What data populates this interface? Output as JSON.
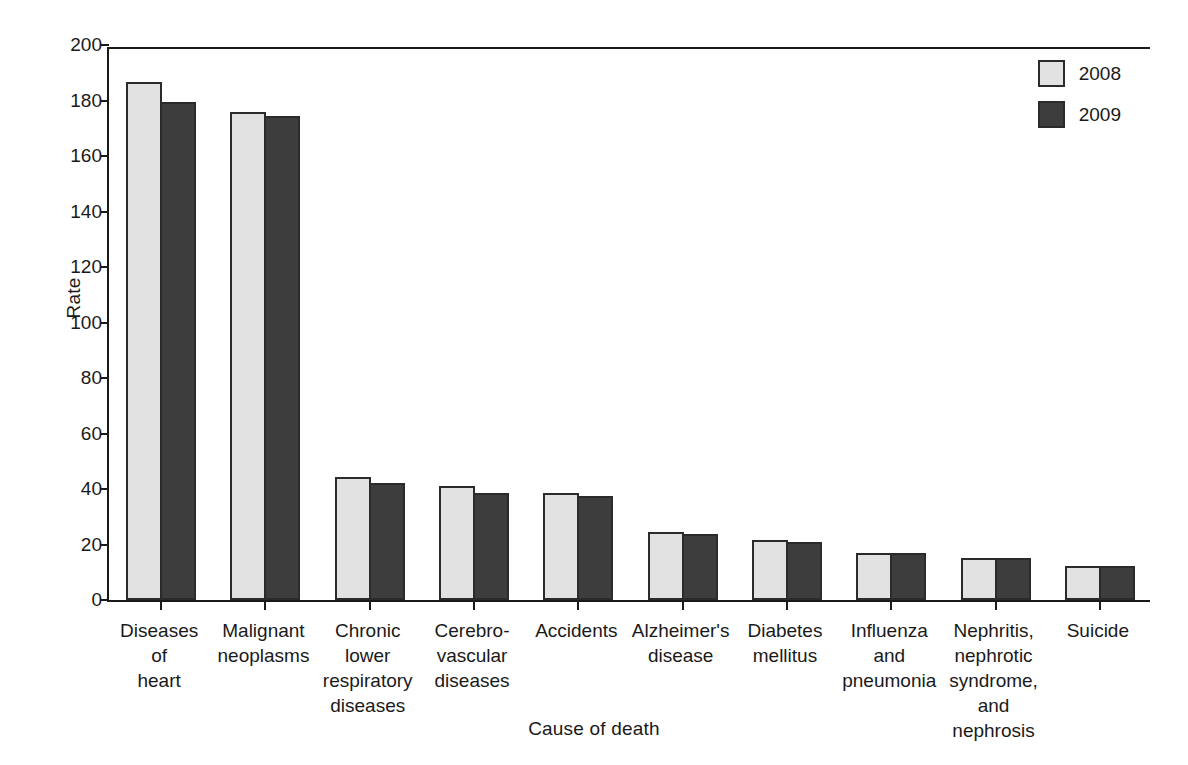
{
  "chart_data": {
    "type": "bar",
    "title": "",
    "xlabel": "Cause of death",
    "ylabel": "Rate",
    "ylim": [
      0,
      200
    ],
    "yticks": [
      0,
      20,
      40,
      60,
      80,
      100,
      120,
      140,
      160,
      180,
      200
    ],
    "grid": false,
    "legend_position": "top-right",
    "categories": [
      "Diseases\nof\nheart",
      "Malignant\nneoplasms",
      "Chronic\nlower\nrespiratory\ndiseases",
      "Cerebro-\nvascular\ndiseases",
      "Accidents",
      "Alzheimer's\ndisease",
      "Diabetes\nmellitus",
      "Influenza\nand\npneumonia",
      "Nephritis,\nnephrotic\nsyndrome,\nand\nnephrosis",
      "Suicide"
    ],
    "category_lines": [
      [
        "Diseases",
        "of",
        "heart"
      ],
      [
        "Malignant",
        "neoplasms"
      ],
      [
        "Chronic",
        "lower",
        "respiratory",
        "diseases"
      ],
      [
        "Cerebro-",
        "vascular",
        "diseases"
      ],
      [
        "Accidents"
      ],
      [
        "Alzheimer's",
        "disease"
      ],
      [
        "Diabetes",
        "mellitus"
      ],
      [
        "Influenza",
        "and",
        "pneumonia"
      ],
      [
        "Nephritis,",
        "nephrotic",
        "syndrome,",
        "and",
        "nephrosis"
      ],
      [
        "Suicide"
      ]
    ],
    "series": [
      {
        "name": "2008",
        "color": "#e2e2e2",
        "values": [
          186.5,
          176.0,
          44.5,
          41.0,
          38.5,
          24.5,
          21.8,
          16.8,
          15.0,
          12.4
        ]
      },
      {
        "name": "2009",
        "color": "#3d3d3d",
        "values": [
          179.6,
          174.3,
          42.2,
          38.5,
          37.5,
          23.9,
          20.8,
          17.0,
          15.0,
          12.4
        ]
      }
    ]
  },
  "legend": {
    "items": [
      {
        "label": "2008",
        "color": "#e2e2e2"
      },
      {
        "label": "2009",
        "color": "#3d3d3d"
      }
    ]
  },
  "axes": {
    "y_title": "Rate",
    "x_title": "Cause of death"
  },
  "colors": {
    "series_2008": "#e2e2e2",
    "series_2009": "#3d3d3d",
    "axis": "#1a1a1a",
    "bar_outline": "#2b2b2b",
    "background": "#ffffff"
  }
}
